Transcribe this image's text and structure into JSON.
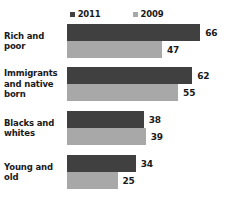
{
  "chart_data": {
    "type": "bar",
    "orientation": "horizontal",
    "title": "",
    "subtitle": "",
    "xlabel": "",
    "ylabel": "",
    "grid": false,
    "legend_position": "top-center",
    "axis_visible": false,
    "tick_labels": [],
    "xlim": [
      0,
      66
    ],
    "categories": [
      "Rich and poor",
      "Immigrants and native born",
      "Blacks and whites",
      "Young and old"
    ],
    "series": [
      {
        "name": "2011",
        "color": "#404040",
        "values": [
          66,
          62,
          38,
          34
        ]
      },
      {
        "name": "2009",
        "color": "#a8a8a8",
        "values": [
          47,
          55,
          39,
          25
        ]
      }
    ],
    "value_labels": [
      [
        "66",
        "47"
      ],
      [
        "62",
        "55"
      ],
      [
        "38",
        "39"
      ],
      [
        "34",
        "25"
      ]
    ]
  },
  "legend": {
    "entries": [
      {
        "label": "2011",
        "color": "#404040",
        "marker": "square-swatch-icon"
      },
      {
        "label": "2009",
        "color": "#a8a8a8",
        "marker": "square-swatch-icon"
      }
    ]
  },
  "colors": {
    "series_2011": "#404040",
    "series_2009": "#a8a8a8",
    "text": "#1a1a1a",
    "background": "#ffffff"
  },
  "layout": {
    "plot_left_px": 67,
    "px_per_unit": 2.02,
    "bar_height_px": 17,
    "group_tops_px": [
      2,
      45,
      89,
      133
    ]
  }
}
